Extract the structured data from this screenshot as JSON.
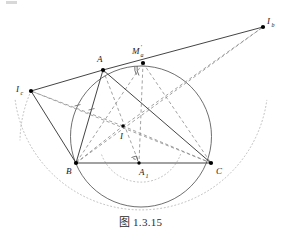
{
  "figure": {
    "caption_prefix": "图",
    "caption_number": "1.3.15",
    "width": 281,
    "height": 247
  },
  "colors": {
    "stroke_solid": "#3a3a3a",
    "stroke_dashed": "#8a8a8a",
    "stroke_dotted": "#b5b5b5",
    "circle": "#555555",
    "point_fill": "#000000",
    "label_text": "#1a1a1a",
    "caption_text": "#2b2b2b",
    "background": "#ffffff"
  },
  "points": [
    {
      "id": "A",
      "label": "A",
      "sub": "",
      "prime": false,
      "x": 103,
      "y": 70,
      "lx": 97,
      "ly": 62
    },
    {
      "id": "B",
      "label": "B",
      "sub": "",
      "prime": false,
      "x": 76,
      "y": 163,
      "lx": 66,
      "ly": 174
    },
    {
      "id": "C",
      "label": "C",
      "sub": "",
      "prime": false,
      "x": 211,
      "y": 163,
      "lx": 216,
      "ly": 174
    },
    {
      "id": "I",
      "label": "I",
      "sub": "",
      "prime": false,
      "x": 123,
      "y": 126,
      "lx": 120,
      "ly": 139
    },
    {
      "id": "A1",
      "label": "A",
      "sub": "1",
      "prime": false,
      "x": 139,
      "y": 163,
      "lx": 142,
      "ly": 175
    },
    {
      "id": "Ma",
      "label": "M",
      "sub": "a",
      "prime": true,
      "x": 143,
      "y": 63,
      "lx": 135,
      "ly": 54
    },
    {
      "id": "Ib",
      "label": "I",
      "sub": "b",
      "prime": false,
      "x": 263,
      "y": 27,
      "lx": 266,
      "ly": 24
    },
    {
      "id": "Ic",
      "label": "I",
      "sub": "c",
      "prime": false,
      "x": 31,
      "y": 91,
      "lx": 18,
      "ly": 92
    }
  ],
  "circumcircle": {
    "cx": 141,
    "cy": 136.5,
    "r": 70.5
  },
  "dotted_arcs": [
    {
      "name": "excircle-arc-outer",
      "cx": 141,
      "cy": 118,
      "r": 127,
      "from_deg": 188,
      "to_deg": 352
    },
    {
      "name": "incircle-arc-lower",
      "cx": 141,
      "cy": 140,
      "r": 42,
      "from_deg": 20,
      "to_deg": 160
    }
  ],
  "solid_segments": [
    {
      "name": "side-BC",
      "from": "B",
      "to": "C"
    },
    {
      "name": "side-AB",
      "from": "A",
      "to": "B"
    },
    {
      "name": "side-AC",
      "from": "A",
      "to": "C"
    },
    {
      "name": "line-Ic-A",
      "from": "Ic",
      "to": "A"
    },
    {
      "name": "line-Ic-B",
      "from": "Ic",
      "to": "B"
    },
    {
      "name": "line-A-Ib",
      "from": "A",
      "to": "Ib"
    },
    {
      "name": "line-Ma-Ib",
      "from": "Ma",
      "to": "Ib"
    }
  ],
  "dashed_segments": [
    {
      "name": "bisector-A-I-A1",
      "from": "A",
      "to": "A1"
    },
    {
      "name": "bisector-B-I",
      "from": "B",
      "to": "I"
    },
    {
      "name": "bisector-C-I",
      "from": "C",
      "to": "I"
    },
    {
      "name": "line-I-Ic",
      "from": "I",
      "to": "Ic"
    },
    {
      "name": "line-I-Ib",
      "from": "I",
      "to": "Ib"
    },
    {
      "name": "line-Ic-C",
      "from": "Ic",
      "to": "C"
    },
    {
      "name": "line-B-Ib",
      "from": "B",
      "to": "Ib"
    },
    {
      "name": "line-Ma-A1",
      "from": "Ma",
      "to": "A1"
    },
    {
      "name": "line-Ma-B",
      "from": "Ma",
      "to": "B"
    },
    {
      "name": "line-Ma-C",
      "from": "Ma",
      "to": "C"
    }
  ],
  "marks": {
    "right_angle_at": "A1",
    "angle_arc_at": "Ma",
    "tick_marks_count": 2
  }
}
